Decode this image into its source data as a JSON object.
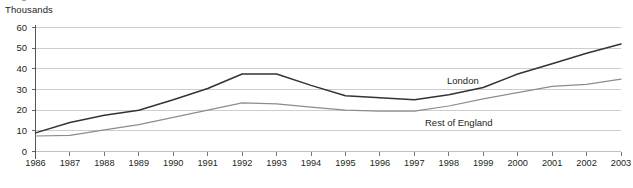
{
  "chart_data": {
    "type": "line",
    "title": "",
    "unit_label": "Thousands",
    "xlabel": "",
    "ylabel": "",
    "x": [
      1986,
      1987,
      1988,
      1989,
      1990,
      1991,
      1992,
      1993,
      1994,
      1995,
      1996,
      1997,
      1998,
      1999,
      2000,
      2001,
      2002,
      2003
    ],
    "xtick_labels": [
      "1986",
      "1987",
      "1988",
      "1989",
      "1990",
      "1991",
      "1992",
      "1993",
      "1994",
      "1995",
      "1996",
      "1997",
      "1998",
      "1999",
      "2000",
      "2001",
      "2002",
      "2003"
    ],
    "ytick_labels": [
      "0",
      "10",
      "20",
      "30",
      "40",
      "50",
      "60"
    ],
    "yticks": [
      0,
      10,
      20,
      30,
      40,
      50,
      60
    ],
    "ylim": [
      0,
      60
    ],
    "xlim": [
      1986,
      2003
    ],
    "grid": "horizontal",
    "legend": "inline-annotations",
    "series": [
      {
        "name": "London",
        "label": "London",
        "color": "#333333",
        "values": [
          9.0,
          14.0,
          17.5,
          20.0,
          25.0,
          30.5,
          37.5,
          37.5,
          32.0,
          27.0,
          26.0,
          25.0,
          27.5,
          31.0,
          37.5,
          42.5,
          47.5,
          52.0
        ]
      },
      {
        "name": "Rest of England",
        "label": "Rest of England",
        "color": "#8c8c8c",
        "values": [
          7.5,
          7.8,
          10.5,
          13.0,
          16.5,
          20.0,
          23.5,
          23.0,
          21.5,
          20.0,
          19.5,
          19.5,
          22.0,
          25.5,
          28.5,
          31.5,
          32.5,
          35.0
        ]
      }
    ],
    "annotations": [
      {
        "text": "London",
        "x_px": 447,
        "y_px": 82
      },
      {
        "text": "Rest of England",
        "x_px": 425,
        "y_px": 124
      }
    ],
    "colors": {
      "gridline": "#b8b8b8",
      "axis": "#555555",
      "text": "#231f20",
      "background": "#ffffff"
    }
  }
}
